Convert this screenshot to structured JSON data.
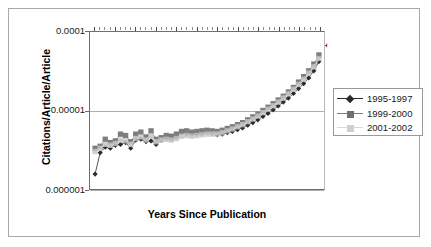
{
  "chart_data": {
    "type": "scatter",
    "title": "",
    "xlabel": "Years Since Publication",
    "ylabel": "Citations/Article/Article",
    "yscale": "log",
    "ylim": [
      1e-06,
      0.0001
    ],
    "ytick_labels": [
      "0.0001",
      "0.00001",
      "0.000001"
    ],
    "ytick_values": [
      0.0001,
      1e-05,
      1e-06
    ],
    "xlim": [
      46,
      0
    ],
    "x_axis_position": "top",
    "x_direction": "descending",
    "xtick_labels": [
      "45",
      "41",
      "37",
      "33",
      "29",
      "25",
      "21",
      "17",
      "13",
      "9",
      "5",
      "1"
    ],
    "xtick_values": [
      45,
      41,
      37,
      33,
      29,
      25,
      21,
      17,
      13,
      9,
      5,
      1
    ],
    "grid": "horizontal",
    "legend_position": "right",
    "x": [
      45,
      44,
      43,
      42,
      41,
      40,
      39,
      38,
      37,
      36,
      35,
      34,
      33,
      32,
      31,
      30,
      29,
      28,
      27,
      26,
      25,
      24,
      23,
      22,
      21,
      20,
      19,
      18,
      17,
      16,
      15,
      14,
      13,
      12,
      11,
      10,
      9,
      8,
      7,
      6,
      5,
      4,
      3,
      2,
      1
    ],
    "series": [
      {
        "name": "1995-1997",
        "color": "#2b2b2b",
        "marker": "diamond",
        "values": [
          1.55e-06,
          2.9e-06,
          3.4e-06,
          3.3e-06,
          3.6e-06,
          3.7e-06,
          3.9e-06,
          3.3e-06,
          4.2e-06,
          4.3e-06,
          4e-06,
          4.1e-06,
          3.7e-06,
          4.2e-06,
          4.4e-06,
          4.3e-06,
          4.6e-06,
          5.2e-06,
          5.1e-06,
          5e-06,
          5e-06,
          5.1e-06,
          5.3e-06,
          5.1e-06,
          4.9e-06,
          5e-06,
          5.2e-06,
          5.4e-06,
          5.7e-06,
          6e-06,
          6.5e-06,
          7e-06,
          7.6e-06,
          8.4e-06,
          9.2e-06,
          1.02e-05,
          1.14e-05,
          1.28e-05,
          1.44e-05,
          1.65e-05,
          1.9e-05,
          2.2e-05,
          2.6e-05,
          3.2e-05,
          4.2e-05
        ]
      },
      {
        "name": "1999-2000",
        "color": "#7d7d7d",
        "marker": "square",
        "values": [
          3.3e-06,
          3.5e-06,
          4.3e-06,
          3.9e-06,
          4.1e-06,
          5e-06,
          4.8e-06,
          4e-06,
          5e-06,
          5.3e-06,
          4.6e-06,
          5.5e-06,
          4.3e-06,
          4.5e-06,
          4.8e-06,
          4.7e-06,
          5e-06,
          5.4e-06,
          5.5e-06,
          5.3e-06,
          5.4e-06,
          5.5e-06,
          5.6e-06,
          5.5e-06,
          5.4e-06,
          5.6e-06,
          5.9e-06,
          6.2e-06,
          6.6e-06,
          7e-06,
          7.6e-06,
          8.3e-06,
          9e-06,
          1e-05,
          1.1e-05,
          1.22e-05,
          1.36e-05,
          1.52e-05,
          1.72e-05,
          1.96e-05,
          2.3e-05,
          2.7e-05,
          3.2e-05,
          3.9e-05,
          5.1e-05
        ]
      },
      {
        "name": "2001-2002",
        "color": "#c6c6c6",
        "marker": "square",
        "values": [
          3e-06,
          3.3e-06,
          3.7e-06,
          3.6e-06,
          3.8e-06,
          4.2e-06,
          4.1e-06,
          3.7e-06,
          4.4e-06,
          4.6e-06,
          4.2e-06,
          4.7e-06,
          4e-06,
          4.2e-06,
          4.3e-06,
          4.2e-06,
          4.4e-06,
          4.7e-06,
          4.8e-06,
          4.7e-06,
          4.8e-06,
          4.9e-06,
          5e-06,
          5e-06,
          5e-06,
          5.2e-06,
          5.5e-06,
          5.8e-06,
          6.2e-06,
          6.6e-06,
          7.2e-06,
          7.8e-06,
          8.5e-06,
          9.4e-06,
          1.04e-05,
          1.15e-05,
          1.28e-05,
          1.44e-05,
          1.63e-05,
          1.86e-05,
          2.15e-05,
          2.5e-05,
          3e-05,
          3.6e-05,
          4.6e-05
        ]
      }
    ]
  },
  "legend": {
    "entries": [
      {
        "label": "1995-1997"
      },
      {
        "label": "1999-2000"
      },
      {
        "label": "2001-2002"
      }
    ]
  }
}
